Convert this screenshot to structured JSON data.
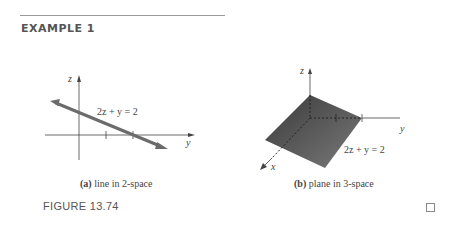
{
  "header": {
    "title": "EXAMPLE 1"
  },
  "figure_a": {
    "axis_z": "z",
    "axis_y": "y",
    "equation": "2z + y = 2",
    "caption_tag": "(a)",
    "caption_text": " line in 2-space"
  },
  "figure_b": {
    "axis_z": "z",
    "axis_y": "y",
    "axis_x": "x",
    "equation": "2z + y = 2",
    "caption_tag": "(b)",
    "caption_text": " plane in 3-space"
  },
  "figure_label": "FIGURE 13.74",
  "colors": {
    "line": "#6b6b6b",
    "plane_dark": "#3a3a3a",
    "plane_light": "#7a7a7a",
    "axis": "#444444"
  }
}
